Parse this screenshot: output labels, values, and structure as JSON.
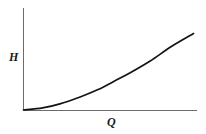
{
  "figure": {
    "background_color": "#ffffff",
    "width": 206,
    "height": 134
  },
  "chart_data": {
    "type": "line",
    "title": "",
    "subtitle": "",
    "xlabel": "Q",
    "ylabel": "H",
    "grid": false,
    "legend": null,
    "axis_color": "#6b6b6b",
    "curve_color": "#141414",
    "xlim": [
      0,
      1
    ],
    "ylim": [
      0,
      1
    ],
    "xticks": [],
    "yticks": [],
    "xticklabels": [],
    "yticklabels": [],
    "annotations": [],
    "series": [
      {
        "name": "H(Q)",
        "description": "convex increasing curve rising from the origin",
        "x": [
          0.0,
          0.11,
          0.21,
          0.33,
          0.43,
          0.52,
          0.61,
          0.73,
          0.85,
          0.98
        ],
        "y": [
          0.0,
          0.02,
          0.06,
          0.13,
          0.2,
          0.28,
          0.36,
          0.48,
          0.62,
          0.75
        ]
      }
    ]
  },
  "labels": {
    "y_axis_label": "H",
    "x_axis_label": "Q"
  }
}
